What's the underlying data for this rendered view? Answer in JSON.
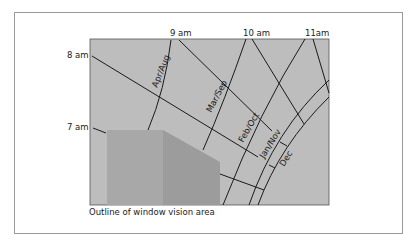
{
  "diagram": {
    "hour_labels": [
      "7 am",
      "8 am",
      "9 am",
      "10 am",
      "11am"
    ],
    "month_labels": [
      "Apr/Aug",
      "Mar/Sep",
      "Feb/Oct",
      "Jan/Nov",
      "Dec"
    ],
    "caption": "Outline of window vision area",
    "colors": {
      "panel": "#bdbdbd",
      "building_front": "#a6a6a6",
      "building_side": "#9a9a9a",
      "lines": "#1a1a1a",
      "frame": "#9a9a9a"
    }
  }
}
